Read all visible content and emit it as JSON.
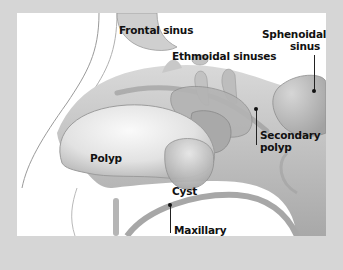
{
  "diagram": {
    "colors": {
      "frame": "#d6d6d6",
      "panel": "#ffffff",
      "tissue": "#bdbdbd",
      "tissue_dark": "#9e9e9e",
      "tissue_light": "#e4e4e4",
      "label_text": "#111111"
    },
    "labels": [
      {
        "id": "frontal-sinus",
        "text": "Frontal sinus"
      },
      {
        "id": "ethmoidal-sinuses",
        "text": "Ethmoidal sinuses"
      },
      {
        "id": "sphenoidal-sinus",
        "line1": "Sphenoidal",
        "line2": "sinus"
      },
      {
        "id": "secondary-polyp",
        "line1": "Secondary",
        "line2": "polyp"
      },
      {
        "id": "polyp",
        "text": "Polyp"
      },
      {
        "id": "cyst",
        "text": "Cyst"
      },
      {
        "id": "maxillary-sinus",
        "line1": "Maxillary",
        "line2": "sinus"
      }
    ]
  }
}
